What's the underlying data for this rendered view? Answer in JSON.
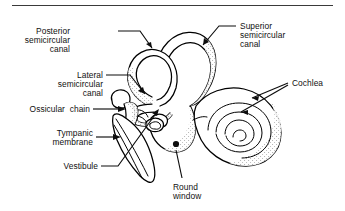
{
  "figure": {
    "background_color": "#ffffff",
    "ink_color": "#000000",
    "has_top_rule": true
  },
  "labels": {
    "posterior_semicircular_canal": {
      "lines": [
        "Posterior",
        "semicircular",
        "canal"
      ],
      "line1": "Posterior",
      "line2": "semicircular",
      "line3": "canal"
    },
    "superior_semicircular_canal": {
      "lines": [
        "Superior",
        "semicircular",
        "canal"
      ],
      "line1": "Superior",
      "line2": "semicircular",
      "line3": "canal"
    },
    "lateral_semicircular_canal": {
      "lines": [
        "Lateral",
        "semicircular",
        "canal"
      ],
      "line1": "Lateral",
      "line2": "semicircular",
      "line3": "canal"
    },
    "cochlea": {
      "line1": "Cochlea"
    },
    "ossicular_chain": {
      "line1": "Ossicular  chain"
    },
    "tympanic_membrane": {
      "lines": [
        "Tympanic",
        "membrane"
      ],
      "line1": "Tympanic",
      "line2": "membrane"
    },
    "vestibule": {
      "line1": "Vestibule"
    },
    "round_window": {
      "lines": [
        "Round",
        "window"
      ],
      "line1": "Round",
      "line2": "window"
    }
  }
}
